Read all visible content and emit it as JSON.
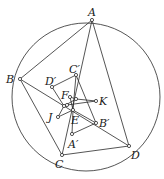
{
  "diagram": {
    "title": "",
    "stroke_color": "#2a2a2a",
    "circle": {
      "cx": 86,
      "cy": 97,
      "r": 74
    },
    "points": [
      {
        "id": "A",
        "label": "A",
        "x": 92,
        "y": 20,
        "lx": 88,
        "ly": 16
      },
      {
        "id": "B",
        "label": "B",
        "x": 20,
        "y": 79,
        "lx": 6,
        "ly": 83
      },
      {
        "id": "C",
        "label": "C",
        "x": 62,
        "y": 155,
        "lx": 55,
        "ly": 168
      },
      {
        "id": "D",
        "label": "D",
        "x": 129,
        "y": 146,
        "lx": 131,
        "ly": 159
      },
      {
        "id": "Cp",
        "label": "C′",
        "x": 76,
        "y": 75,
        "lx": 69,
        "ly": 73
      },
      {
        "id": "Dp",
        "label": "D′",
        "x": 52,
        "y": 87,
        "lx": 45,
        "ly": 85
      },
      {
        "id": "Bp",
        "label": "B′",
        "x": 96,
        "y": 123,
        "lx": 99,
        "ly": 127
      },
      {
        "id": "Ap",
        "label": "A′",
        "x": 72,
        "y": 134,
        "lx": 68,
        "ly": 148
      },
      {
        "id": "E",
        "label": "E",
        "x": 73,
        "y": 110,
        "lx": 71,
        "ly": 124
      },
      {
        "id": "F",
        "label": "F",
        "x": 70,
        "y": 97,
        "lx": 61,
        "ly": 99
      },
      {
        "id": "F2",
        "label": "",
        "x": 76,
        "y": 99,
        "lx": 0,
        "ly": 0
      },
      {
        "id": "K",
        "label": "K",
        "x": 96,
        "y": 101,
        "lx": 99,
        "ly": 105
      },
      {
        "id": "J",
        "label": "J",
        "x": 58,
        "y": 117,
        "lx": 48,
        "ly": 121
      },
      {
        "id": "P1",
        "label": "",
        "x": 64,
        "y": 106,
        "lx": 0,
        "ly": 0
      },
      {
        "id": "P2",
        "label": "",
        "x": 67,
        "y": 105,
        "lx": 0,
        "ly": 0
      }
    ],
    "segments": [
      [
        "A",
        "B"
      ],
      [
        "B",
        "C"
      ],
      [
        "C",
        "D"
      ],
      [
        "A",
        "D"
      ],
      [
        "A",
        "C"
      ],
      [
        "B",
        "D"
      ],
      [
        "Cp",
        "Dp"
      ],
      [
        "Dp",
        "P1"
      ],
      [
        "Cp",
        "Bp"
      ],
      [
        "Bp",
        "Ap"
      ],
      [
        "Ap",
        "E"
      ],
      [
        "F",
        "F2"
      ],
      [
        "F2",
        "K"
      ],
      [
        "P2",
        "K"
      ],
      [
        "J",
        "P1"
      ],
      [
        "J",
        "E"
      ],
      [
        "E",
        "Bp"
      ],
      [
        "F",
        "E"
      ],
      [
        "P1",
        "F2"
      ],
      [
        "Cp",
        "E"
      ]
    ]
  }
}
